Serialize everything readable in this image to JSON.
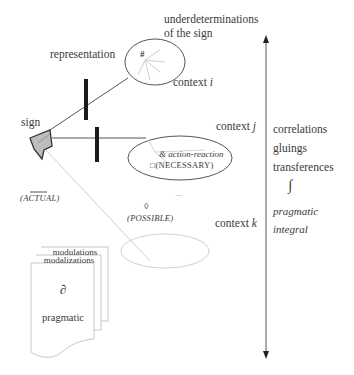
{
  "diagram": {
    "labels": {
      "underdetermination_line1": "underdeterminations",
      "underdetermination_line2": "of the sign",
      "representation": "representation",
      "hash": "#",
      "context_i_word": "context",
      "context_i_var": "i",
      "sign": "sign",
      "context_j_word": "context",
      "context_j_var": "j",
      "action_reaction_prefix": "&",
      "action_reaction": "action-reaction",
      "necessary_box": "□",
      "necessary": "(NECESSARY)",
      "actual": "(ACTUAL)",
      "ellipsis": "...",
      "possible_diamond": "◊",
      "possible": "(POSSIBLE)",
      "context_k_word": "context",
      "context_k_var": "k"
    },
    "stack": {
      "back_label": "modulations",
      "middle_label": "modalizations",
      "partial_symbol": "∂",
      "front_label": "pragmatic"
    },
    "right_column": {
      "items": [
        "correlations",
        "gluings",
        "transferences"
      ],
      "integral_symbol": "∫",
      "pragmatic": "pragmatic",
      "integral": "integral"
    },
    "colors": {
      "line_dark": "#444444",
      "line_light": "#c8c8c8",
      "sign_fill": "#bdbdbd",
      "bar": "#1a1a1a",
      "text": "#3a3a3a"
    }
  }
}
